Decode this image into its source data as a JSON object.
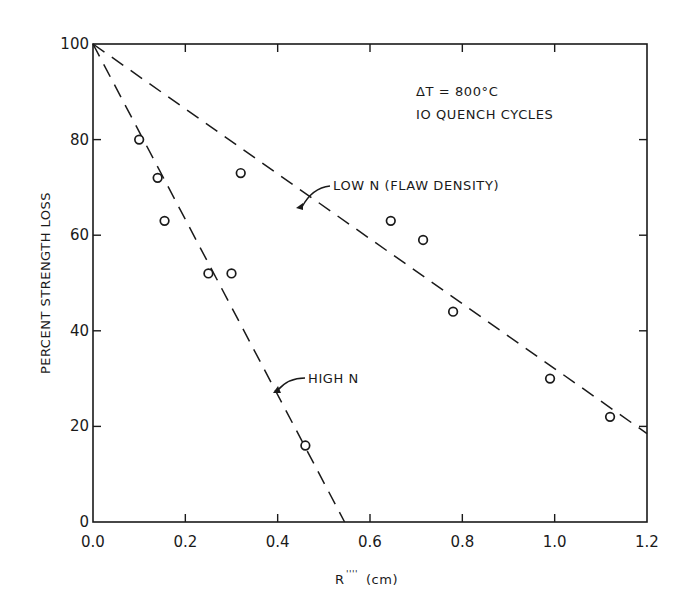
{
  "chart_data": {
    "type": "scatter",
    "title": "",
    "xlabel": "R'''' (cm)",
    "ylabel": "PERCENT STRENGTH LOSS",
    "xlim": [
      0.0,
      1.2
    ],
    "ylim": [
      0,
      100
    ],
    "x_ticks": [
      "0.0",
      "0.2",
      "0.4",
      "0.6",
      "0.8",
      "1.0",
      "1.2"
    ],
    "y_ticks": [
      "0",
      "20",
      "40",
      "60",
      "80",
      "100"
    ],
    "grid": false,
    "annotations": [
      "ΔT = 800°C",
      "10 QUENCH CYCLES"
    ],
    "points": [
      {
        "x": 0.1,
        "y": 80
      },
      {
        "x": 0.14,
        "y": 72
      },
      {
        "x": 0.155,
        "y": 63
      },
      {
        "x": 0.25,
        "y": 52
      },
      {
        "x": 0.3,
        "y": 52
      },
      {
        "x": 0.32,
        "y": 73
      },
      {
        "x": 0.46,
        "y": 16
      },
      {
        "x": 0.645,
        "y": 63
      },
      {
        "x": 0.715,
        "y": 59
      },
      {
        "x": 0.78,
        "y": 44
      },
      {
        "x": 0.99,
        "y": 30
      },
      {
        "x": 1.12,
        "y": 22
      }
    ],
    "series": [
      {
        "name": "HIGH N",
        "style": "dashed",
        "x": [
          0.0,
          0.545
        ],
        "y": [
          100,
          0
        ]
      },
      {
        "name": "LOW N (FLAW DENSITY)",
        "style": "dashed",
        "x": [
          0.0,
          1.2
        ],
        "y": [
          100,
          18.5
        ]
      }
    ]
  },
  "labels": {
    "annot_line1": "ΔT = 800°C",
    "annot_line2": "IO QUENCH CYCLES",
    "low_n": "LOW N (FLAW DENSITY)",
    "high_n": "HIGH N",
    "xlabel_main": "R",
    "xlabel_sup": "''''",
    "xlabel_unit": "(cm)",
    "ylabel": "PERCENT STRENGTH LOSS"
  },
  "colors": {
    "ink": "#1a1a1a",
    "background": "#ffffff"
  }
}
